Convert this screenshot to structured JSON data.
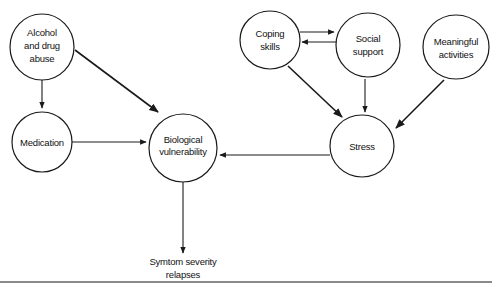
{
  "diagram": {
    "type": "causal-flow",
    "nodes": [
      {
        "id": "alcohol",
        "lines": [
          "Alcohol",
          "and drug",
          "abuse"
        ],
        "cx": 42,
        "cy": 47,
        "r": 33
      },
      {
        "id": "medication",
        "lines": [
          "Medication"
        ],
        "cx": 42,
        "cy": 142,
        "r": 30
      },
      {
        "id": "biological",
        "lines": [
          "Biological",
          "vulnerability"
        ],
        "cx": 183,
        "cy": 148,
        "r": 34
      },
      {
        "id": "coping",
        "lines": [
          "Coping",
          "skills"
        ],
        "cx": 270,
        "cy": 42,
        "r": 30
      },
      {
        "id": "social",
        "lines": [
          "Social",
          "support"
        ],
        "cx": 368,
        "cy": 47,
        "r": 32
      },
      {
        "id": "meaningful",
        "lines": [
          "Meaningful",
          "activities"
        ],
        "cx": 455,
        "cy": 50,
        "r": 35
      },
      {
        "id": "stress",
        "lines": [
          "Stress"
        ],
        "cx": 362,
        "cy": 146,
        "r": 32
      }
    ],
    "outcome": {
      "id": "symptom",
      "lines": [
        "Symtom severity",
        "relapses"
      ],
      "x": 183,
      "y": 263
    },
    "edges": [
      {
        "from": "alcohol",
        "to": "medication"
      },
      {
        "from": "alcohol",
        "to": "biological"
      },
      {
        "from": "medication",
        "to": "biological"
      },
      {
        "from": "stress",
        "to": "biological"
      },
      {
        "from": "biological",
        "to": "symptom"
      },
      {
        "from": "coping",
        "to": "social"
      },
      {
        "from": "social",
        "to": "coping"
      },
      {
        "from": "coping",
        "to": "stress"
      },
      {
        "from": "social",
        "to": "stress"
      },
      {
        "from": "meaningful",
        "to": "stress"
      }
    ],
    "labels": {
      "alcohol_1": "Alcohol",
      "alcohol_2": "and drug",
      "alcohol_3": "abuse",
      "medication": "Medication",
      "biological_1": "Biological",
      "biological_2": "vulnerability",
      "coping_1": "Coping",
      "coping_2": "skills",
      "social_1": "Social",
      "social_2": "support",
      "meaningful_1": "Meaningful",
      "meaningful_2": "activities",
      "stress": "Stress",
      "symptom_1": "Symtom severity",
      "symptom_2": "relapses"
    }
  },
  "colors": {
    "stroke": "#1a1a1a",
    "background": "#ffffff",
    "rule": "#8a8a8a"
  }
}
